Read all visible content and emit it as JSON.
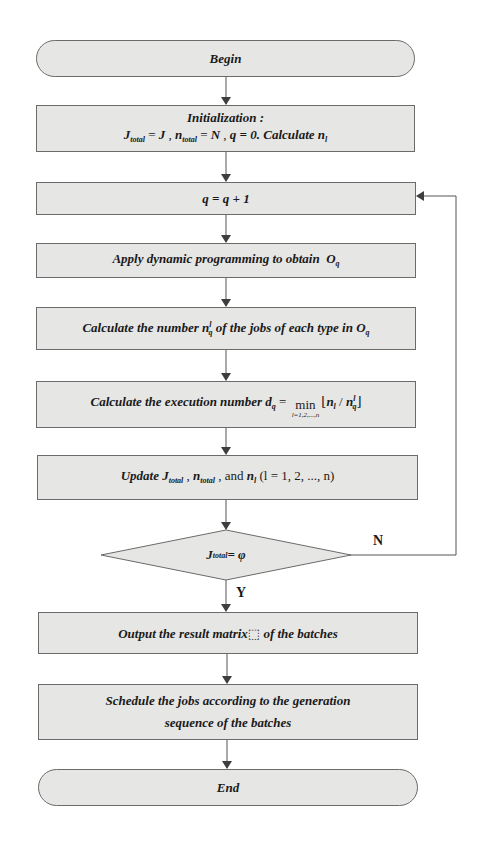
{
  "flowchart": {
    "begin": {
      "label": "Begin"
    },
    "init": {
      "title": "Initialization :",
      "line2": {
        "J": "J",
        "total_sub": "total",
        "eq": " = ",
        "J_val": "J",
        "sep1": " , ",
        "n": "n",
        "n_total_sub": "total",
        "N_val": "N",
        "sep2": " , ",
        "q_assign": "q = 0. ",
        "calc": "Calculate ",
        "n_l": "n",
        "l_sub": "l"
      }
    },
    "increment": {
      "text": "q = q + 1"
    },
    "apply_dp": {
      "text": "Apply dynamic programming to obtain ",
      "O": "O",
      "q_sub": "q"
    },
    "calc_count": {
      "text_before": "Calculate the number ",
      "n": "n",
      "q_sub": "q",
      "l_sup": "l",
      "text_after": " of  the  jobs of  each type in ",
      "O": "O",
      "O_sub": "q"
    },
    "calc_exec": {
      "text_before": "Calculate the execution number ",
      "d": "d",
      "d_sub": "q",
      "eq": " = ",
      "min_word": "min",
      "min_sub": "l=1,2,...,n",
      "floor_open": "⌊",
      "n_l": "n",
      "l_sub": "l",
      "slash": " / ",
      "n_q": "n",
      "q_sub": "q",
      "l_sup": "l",
      "floor_close": "⌋"
    },
    "update": {
      "word": "Update ",
      "J": "J",
      "total_sub": "total",
      "comma1": " , ",
      "n": "n",
      "n_total_sub": "total",
      "comma2": " , ",
      "and": "and ",
      "n_l": "n",
      "l_sub": "l",
      "range": " (l = 1, 2, ..., n)"
    },
    "decision": {
      "J": "J",
      "total_sub": "total",
      "rest": " = φ",
      "yes_label": "Y",
      "no_label": "N"
    },
    "output": {
      "text": "Output the result matrix⬚ of  the batches"
    },
    "schedule": {
      "line1": "Schedule the  jobs according to the generation",
      "line2": "sequence of  the batches"
    },
    "end": {
      "label": "End"
    }
  },
  "colors": {
    "node_fill": "#e6e6e4",
    "node_border": "#6b6b6b",
    "arrow": "#4a4a4a",
    "background": "#ffffff"
  }
}
